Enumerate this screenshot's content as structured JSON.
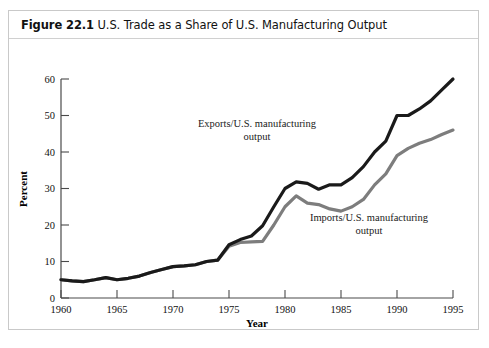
{
  "figure": {
    "number_label": "Figure 22.1",
    "title": "U.S. Trade as a Share of U.S. Manufacturing Output"
  },
  "chart_data": {
    "type": "line",
    "title": "U.S. Trade as a Share of U.S. Manufacturing Output",
    "xlabel": "Year",
    "ylabel": "Percent",
    "xlim": [
      1960,
      1995
    ],
    "ylim": [
      0,
      60
    ],
    "xticks": [
      1960,
      1965,
      1970,
      1975,
      1980,
      1985,
      1990,
      1995
    ],
    "xtick_labels": [
      "1960",
      "1965",
      "1970",
      "1975",
      "1980",
      "1985",
      "1990",
      "1995"
    ],
    "yticks": [
      0,
      10,
      20,
      30,
      40,
      50,
      60
    ],
    "ytick_labels": [
      "0",
      "10",
      "20",
      "30",
      "40",
      "50",
      "60"
    ],
    "grid": false,
    "legend": "annotations",
    "x": [
      1960,
      1961,
      1962,
      1963,
      1964,
      1965,
      1966,
      1967,
      1968,
      1969,
      1970,
      1971,
      1972,
      1973,
      1974,
      1975,
      1976,
      1977,
      1978,
      1979,
      1980,
      1981,
      1982,
      1983,
      1984,
      1985,
      1986,
      1987,
      1988,
      1989,
      1990,
      1991,
      1992,
      1993,
      1994,
      1995
    ],
    "series": [
      {
        "name": "Exports/U.S. manufacturing output",
        "color": "#1a1a1a",
        "annotation": "Exports/U.S. manufacturing\noutput",
        "values": [
          5.0,
          4.7,
          4.5,
          5.0,
          5.6,
          5.0,
          5.4,
          6.0,
          7.0,
          7.8,
          8.6,
          8.8,
          9.1,
          10.0,
          10.4,
          14.6,
          16.0,
          17.0,
          19.8,
          25.0,
          30.0,
          31.8,
          31.4,
          29.8,
          31.0,
          31.0,
          33.0,
          36.0,
          40.0,
          43.0,
          50.0,
          50.0,
          51.8,
          54.0,
          57.0,
          60.0
        ]
      },
      {
        "name": "Imports/U.S. manufacturing output",
        "color": "#7d7d7d",
        "annotation": "Imports/U.S. manufacturing\noutput",
        "values": [
          5.0,
          4.7,
          4.5,
          5.0,
          5.6,
          5.0,
          5.4,
          6.0,
          7.0,
          7.8,
          8.6,
          8.8,
          9.1,
          10.0,
          10.4,
          14.2,
          15.2,
          15.4,
          15.5,
          20.0,
          25.0,
          28.0,
          26.0,
          25.6,
          24.4,
          23.8,
          25.0,
          27.0,
          31.0,
          34.0,
          39.0,
          41.0,
          42.4,
          43.4,
          44.8,
          46.0
        ]
      }
    ]
  }
}
